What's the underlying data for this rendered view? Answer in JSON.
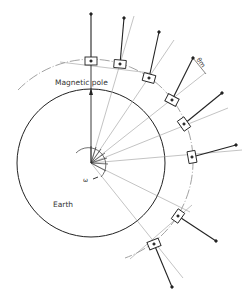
{
  "figure": {
    "type": "diagram",
    "labels": {
      "magnetic_pole": "Magnetic pole",
      "earth": "Earth",
      "omega": "ω",
      "theta_m": "θm"
    },
    "colors": {
      "line": "#222222",
      "construction": "#9a9a9a",
      "background": "#ffffff"
    },
    "geometry": {
      "center": [
        91,
        163
      ],
      "earth_radius": 74,
      "orbit_radius": 102
    },
    "satellites": [
      {
        "box": [
          91,
          61
        ],
        "angle": 0,
        "tip": [
          91,
          14
        ]
      },
      {
        "box": [
          120,
          64
        ],
        "angle": 13,
        "tip": [
          124,
          18
        ]
      },
      {
        "box": [
          149,
          78
        ],
        "angle": 22,
        "tip": [
          159,
          32
        ]
      },
      {
        "box": [
          172,
          100
        ],
        "angle": 30,
        "tip": [
          193,
          58
        ]
      },
      {
        "box": [
          184,
          124
        ],
        "angle": 40,
        "tip": [
          222,
          93
        ]
      },
      {
        "box": [
          192,
          157
        ],
        "angle": 75,
        "tip": [
          236,
          145
        ]
      },
      {
        "box": [
          178,
          216
        ],
        "angle": -60,
        "tip": [
          216,
          241
        ]
      },
      {
        "box": [
          154,
          244
        ],
        "angle": -20,
        "tip": [
          172,
          287
        ]
      }
    ]
  }
}
